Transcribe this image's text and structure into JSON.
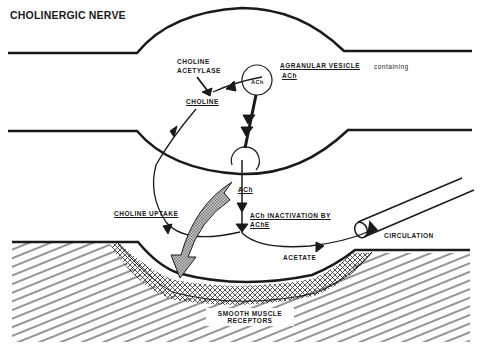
{
  "diagram": {
    "title": "CHOLINERGIC NERVE",
    "labels": {
      "choline_acetylase_line1": "CHOLINE",
      "choline_acetylase_line2": "ACETYLASE",
      "choline": "CHOLINE",
      "vesicle_ach": "ACh",
      "agranular_vesicle": "AGRANULAR VESICLE",
      "containing": "containing",
      "vesicle_caption_ach": "ACh",
      "released_ach": "ACh",
      "inactivation_line1": "ACh INACTIVATION BY",
      "inactivation_line2": "AChE",
      "choline_uptake": "CHOLINE UPTAKE",
      "acetate": "ACETATE",
      "circulation": "CIRCULATION",
      "receptors_line1": "SMOOTH MUSCLE",
      "receptors_line2": "RECEPTORS"
    },
    "colors": {
      "ink": "#1a1a1a",
      "background": "#ffffff",
      "stipple": "#8a8a8a"
    }
  }
}
